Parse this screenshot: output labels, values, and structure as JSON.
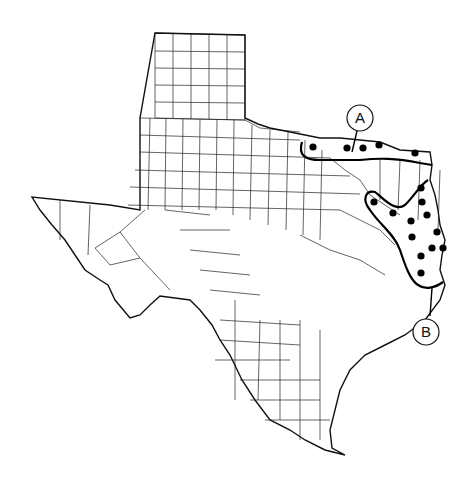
{
  "map": {
    "subject": "Texas counties",
    "colors": {
      "background": "#ffffff",
      "lines": "#111111",
      "dots": "#000000"
    },
    "regions": [
      {
        "label": "A",
        "label_pos": [
          360,
          118
        ],
        "leader": [
          [
            357,
            131
          ],
          [
            352,
            152
          ]
        ],
        "dots": [
          [
            313,
            147
          ],
          [
            347,
            148
          ],
          [
            363,
            148
          ],
          [
            379,
            145
          ],
          [
            415,
            153
          ]
        ]
      },
      {
        "label": "B",
        "label_pos": [
          426,
          332
        ],
        "leader": [
          [
            430,
            316
          ],
          [
            432,
            288
          ]
        ],
        "dots": [
          [
            421,
            188
          ],
          [
            422,
            202
          ],
          [
            374,
            202
          ],
          [
            393,
            213
          ],
          [
            427,
            215
          ],
          [
            411,
            221
          ],
          [
            437,
            232
          ],
          [
            412,
            237
          ],
          [
            432,
            248
          ],
          [
            443,
            248
          ],
          [
            421,
            256
          ],
          [
            421,
            273
          ]
        ]
      }
    ]
  }
}
